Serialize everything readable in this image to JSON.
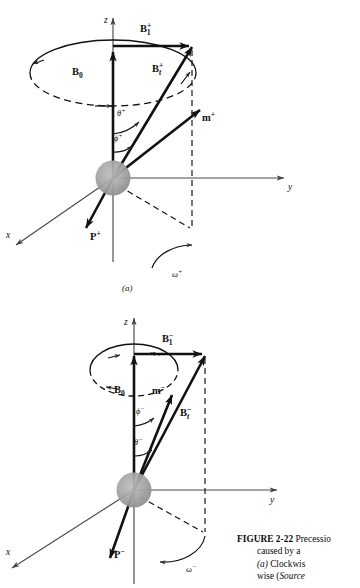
{
  "figure": {
    "number": "FIGURE 2-22",
    "caption_lines": [
      "FIGURE 2-22 Precessio",
      "caused by a",
      "(a) Clockwis",
      "wise (Source"
    ],
    "caption_line1_bold": "FIGURE",
    "caption_line1_num": "2-22",
    "caption_line1_rest": "Precessio",
    "caption_line2": "caused  by  a",
    "caption_line3_italic": "(a)",
    "caption_line3_rest": "Clockwis",
    "caption_line4_pre": "wise  (",
    "caption_line4_italic": "Source"
  },
  "panels": [
    {
      "id": "a",
      "letter": "(a)",
      "sign": "+",
      "axes": {
        "z": "z",
        "y": "y",
        "x": "x"
      },
      "vectors": {
        "b0": "B",
        "b0_sub": "0",
        "b1": "B",
        "b1_sub": "1",
        "b1_sup": "+",
        "bt": "B",
        "bt_sub": "t",
        "bt_sup": "+",
        "m": "m",
        "m_sup": "+",
        "p": "P",
        "p_sup": "+"
      },
      "angles": {
        "theta": "θ",
        "theta_sup": "+",
        "phi": "ϕ",
        "phi_sup": "+"
      },
      "omega": {
        "symbol": "ω",
        "sup": "+",
        "direction": "clockwise"
      }
    },
    {
      "id": "b",
      "letter": "(b)",
      "sign": "-",
      "axes": {
        "z": "z",
        "y": "y",
        "x": "x"
      },
      "vectors": {
        "b0": "B",
        "b0_sub": "0",
        "b1": "B",
        "b1_sub": "1",
        "b1_sup": "−",
        "bt": "B",
        "bt_sub": "t",
        "bt_sup": "−",
        "m": "m",
        "m_sup": "−",
        "p": "P",
        "p_sup": "−"
      },
      "angles": {
        "theta": "θ",
        "theta_sup": "−",
        "phi": "ϕ",
        "phi_sup": "−"
      },
      "omega": {
        "symbol": "ω",
        "sup": "−",
        "direction": "counter-clockwise"
      }
    }
  ],
  "colors": {
    "ink": "#111111",
    "axis": "#4a4a4a",
    "sphere": "#9b9b9b",
    "background": "#ffffff"
  }
}
